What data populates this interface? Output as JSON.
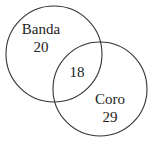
{
  "diagram": {
    "type": "venn",
    "sets": [
      {
        "name": "Banda",
        "only_count": "20"
      },
      {
        "name": "Coro",
        "only_count": "29"
      }
    ],
    "intersection_count": "18",
    "colors": {
      "stroke": "#333333",
      "text": "#222222",
      "background": "#ffffff"
    }
  }
}
